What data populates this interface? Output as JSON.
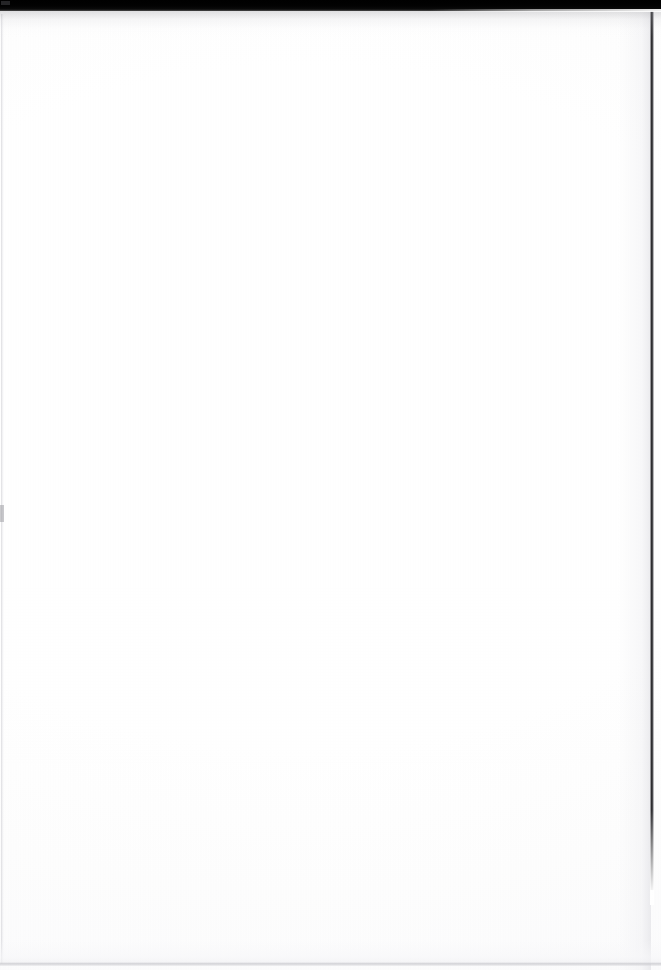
{
  "document": {
    "page_kind": "scanned-blank-page",
    "page_text": "",
    "body_text": "",
    "visible_text_lines": []
  },
  "canvas": {
    "width": 661,
    "height": 970
  },
  "colors": {
    "paper": "#ffffff",
    "scan_bar": "#000000",
    "right_edge_line": "#19191c",
    "left_edge_line": "#d6d6da",
    "bottom_edge_line": "#c4c4c9",
    "corner_artifact": "#2b2b2e"
  },
  "artifacts": {
    "top_scan_bar": "top-scan-bar",
    "top_corner_mark": "scan-corner-artifact",
    "right_edge": "right-scan-edge",
    "left_edge": "left-scan-edge",
    "left_margin_tick": "left-margin-tick",
    "bottom_edge": "bottom-scan-edge",
    "paper_grain": "paper-grain-texture"
  }
}
